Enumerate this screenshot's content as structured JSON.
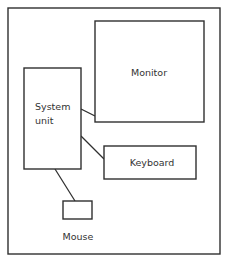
{
  "diagram": {
    "type": "block-diagram",
    "frame": {
      "x": 8,
      "y": 8,
      "w": 212,
      "h": 246
    },
    "nodes": [
      {
        "id": "monitor",
        "label": "Monitor",
        "x": 95,
        "y": 21,
        "w": 109,
        "h": 101,
        "label_x": 149,
        "label_y": 76
      },
      {
        "id": "system",
        "label_lines": [
          "System",
          "unit"
        ],
        "x": 24,
        "y": 68,
        "w": 57,
        "h": 101,
        "label_x": 35,
        "label_y": [
          110,
          124
        ]
      },
      {
        "id": "keyboard",
        "label": "Keyboard",
        "x": 104,
        "y": 146,
        "w": 92,
        "h": 33,
        "label_x": 152,
        "label_y": 166
      },
      {
        "id": "mouse",
        "label": "Mouse",
        "x": 63,
        "y": 201,
        "w": 29,
        "h": 18,
        "label_x": 78,
        "label_y": 240
      }
    ],
    "edges": [
      {
        "from": "system",
        "to": "monitor",
        "x1": 81,
        "y1": 109,
        "x2": 95,
        "y2": 116
      },
      {
        "from": "system",
        "to": "keyboard",
        "x1": 81,
        "y1": 136,
        "x2": 104,
        "y2": 159
      },
      {
        "from": "system",
        "to": "mouse",
        "x1": 55,
        "y1": 169,
        "x2": 75,
        "y2": 201
      }
    ],
    "labels": {
      "monitor": "Monitor",
      "system_line1": "System",
      "system_line2": "unit",
      "keyboard": "Keyboard",
      "mouse": "Mouse"
    },
    "colors": {
      "stroke": "#2f2f2f",
      "text": "#333333",
      "background": "#ffffff"
    }
  }
}
